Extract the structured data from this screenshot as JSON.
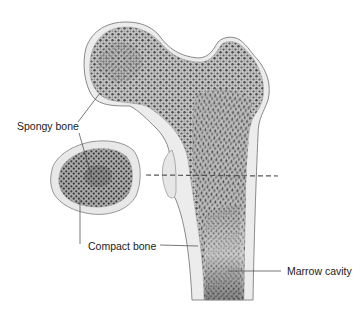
{
  "diagram": {
    "labels": {
      "spongy_bone": "Spongy bone",
      "compact_bone": "Compact bone",
      "marrow_cavity": "Marrow cavity"
    },
    "colors": {
      "background": "#ffffff",
      "compact_bone_fill": "#e9e9e9",
      "compact_bone_outline": "#8a8a8a",
      "spongy_fill": "#b9b9b9",
      "spongy_dots": "#4a4a4a",
      "marrow_dark": "#3a3a3a",
      "leader_line": "#555555",
      "dashed_line": "#555555"
    }
  }
}
